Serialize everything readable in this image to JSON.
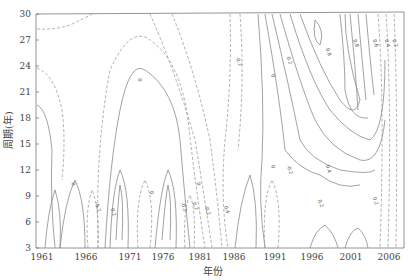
{
  "chart_data": {
    "type": "contour",
    "title": "",
    "xlabel": "年份",
    "ylabel": "周期(年)",
    "x_ticks": [
      "1961",
      "1966",
      "1971",
      "1976",
      "1981",
      "1986",
      "1991",
      "1996",
      "2001",
      "2006"
    ],
    "y_ticks": [
      "3",
      "6",
      "9",
      "12",
      "15",
      "18",
      "21",
      "24",
      "27",
      "30"
    ],
    "xlim": [
      1961,
      2008
    ],
    "ylim": [
      3,
      30
    ],
    "grid": false,
    "legend": "none",
    "line_styles": {
      "positive": "solid",
      "negative": "dashed"
    },
    "contour_labels": [
      {
        "x": 1974,
        "y": 22.5,
        "text": "0"
      },
      {
        "x": 1986.5,
        "y": 25,
        "text": "-0.2"
      },
      {
        "x": 1991,
        "y": 23,
        "text": "0"
      },
      {
        "x": 1993,
        "y": 25,
        "text": "0.2"
      },
      {
        "x": 1998,
        "y": 26,
        "text": "0.8"
      },
      {
        "x": 2001.5,
        "y": 27,
        "text": "0.8"
      },
      {
        "x": 2004,
        "y": 27,
        "text": "0.6"
      },
      {
        "x": 2005.5,
        "y": 27,
        "text": "0.4"
      },
      {
        "x": 2006.5,
        "y": 27,
        "text": "0.2"
      },
      {
        "x": 1965.5,
        "y": 10.5,
        "text": "0"
      },
      {
        "x": 1968.5,
        "y": 8.2,
        "text": "-0.2"
      },
      {
        "x": 1970.5,
        "y": 7.5,
        "text": "0.2"
      },
      {
        "x": 1975.5,
        "y": 9.5,
        "text": "0"
      },
      {
        "x": 1979.5,
        "y": 8.2,
        "text": "-0.2"
      },
      {
        "x": 1981,
        "y": 8.2,
        "text": "0.2"
      },
      {
        "x": 1981.5,
        "y": 10.5,
        "text": "0"
      },
      {
        "x": 1982.5,
        "y": 7.8,
        "text": "-0.2"
      },
      {
        "x": 1985,
        "y": 7.8,
        "text": "0.4"
      },
      {
        "x": 1991,
        "y": 12.5,
        "text": "0"
      },
      {
        "x": 1993,
        "y": 12.5,
        "text": "-0.2"
      },
      {
        "x": 1998,
        "y": 12.5,
        "text": "0.4"
      },
      {
        "x": 1997,
        "y": 8.5,
        "text": "0.2"
      },
      {
        "x": 2004,
        "y": 8.8,
        "text": "0.2"
      }
    ]
  },
  "axes": {
    "xlabel": "年份",
    "ylabel": "周期(年)"
  }
}
